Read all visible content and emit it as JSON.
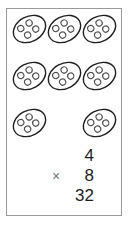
{
  "worksheet": {
    "title": "multiplication array of eggs",
    "frame_color": "#9a9a9a",
    "ink_color": "#1c1c1c",
    "operator_color": "#6f6f6f",
    "group_count": 8,
    "items_per_group": 4,
    "group_label": "oval with four dots",
    "item_label": "dot",
    "rows": [
      {
        "row_index": 0,
        "groups": 3
      },
      {
        "row_index": 1,
        "groups": 3
      },
      {
        "row_index": 2,
        "groups": 2
      }
    ],
    "group_positions": [
      {
        "id": 1,
        "x": 13,
        "y": 16,
        "w": 33,
        "h": 26,
        "rotate": -28
      },
      {
        "id": 2,
        "x": 48,
        "y": 16,
        "w": 33,
        "h": 26,
        "rotate": -28
      },
      {
        "id": 3,
        "x": 83,
        "y": 16,
        "w": 33,
        "h": 26,
        "rotate": -28
      },
      {
        "id": 4,
        "x": 13,
        "y": 63,
        "w": 33,
        "h": 26,
        "rotate": -28
      },
      {
        "id": 5,
        "x": 48,
        "y": 63,
        "w": 33,
        "h": 26,
        "rotate": -28
      },
      {
        "id": 6,
        "x": 83,
        "y": 63,
        "w": 33,
        "h": 26,
        "rotate": -28
      },
      {
        "id": 7,
        "x": 13,
        "y": 110,
        "w": 33,
        "h": 26,
        "rotate": -28
      },
      {
        "id": 8,
        "x": 83,
        "y": 110,
        "w": 33,
        "h": 26,
        "rotate": -28
      }
    ]
  },
  "equation": {
    "multiplicand": "4",
    "operator": "×",
    "multiplier": "8",
    "product": "32"
  }
}
